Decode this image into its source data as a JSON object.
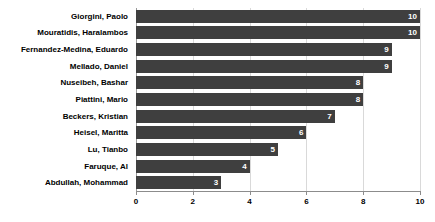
{
  "chart_data": {
    "type": "bar",
    "orientation": "horizontal",
    "title": "",
    "xlabel": "",
    "ylabel": "",
    "categories": [
      "Giorgini, Paolo",
      "Mouratidis, Haralambos",
      "Fernandez-Medina, Eduardo",
      "Mellado, Daniel",
      "Nuseibeh, Bashar",
      "Piattini, Mario",
      "Beckers, Kristian",
      "Heisel, Maritta",
      "Lu, Tianbo",
      "Faruque, Al",
      "Abdullah, Mohammad"
    ],
    "values": [
      10,
      10,
      9,
      9,
      8,
      8,
      7,
      6,
      5,
      4,
      3
    ],
    "value_labels": [
      "10",
      "10",
      "9",
      "9",
      "8",
      "8",
      "7",
      "6",
      "5",
      "4",
      "3"
    ],
    "xlim": [
      0,
      10
    ],
    "xticks": [
      0,
      2,
      4,
      6,
      8,
      10
    ],
    "xtick_labels": [
      "0",
      "2",
      "4",
      "6",
      "8",
      "10"
    ],
    "grid": true,
    "grid_axis": "x",
    "legend": false,
    "bar_color": "#3f3f3f",
    "value_label_color": "#ffffff",
    "gridline_color": "#d9d9d9",
    "axis_color": "#8c8c8c",
    "background_color": "#ffffff",
    "text_color": "#000000"
  }
}
